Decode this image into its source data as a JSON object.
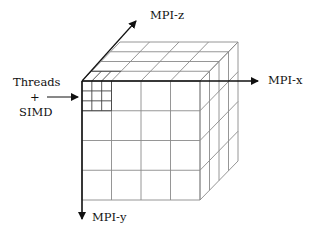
{
  "diagram": {
    "type": "3D domain decomposition cube",
    "labels": {
      "mpi_x": "MPI-x",
      "mpi_y": "MPI-y",
      "mpi_z": "MPI-z",
      "threads": "Threads",
      "plus": "+",
      "simd": "SIMD"
    },
    "grid": {
      "front_columns": 4,
      "front_rows": 4,
      "depth_layers": 4,
      "subdivided_cell": {
        "rows": 3,
        "columns": 3
      }
    },
    "colors": {
      "axis": "#111111",
      "grid_line": "#8a8a8a",
      "subgrid_line": "#444444",
      "background": "#ffffff"
    }
  }
}
